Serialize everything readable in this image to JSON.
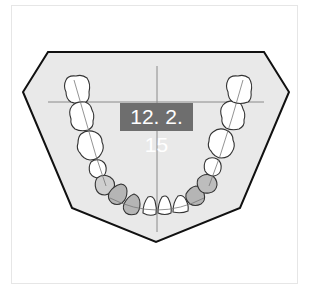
{
  "diagram": {
    "type": "dental-arch",
    "label": "12. 2. 15",
    "colors": {
      "base_fill": "#e9e9e9",
      "base_stroke": "#111111",
      "crosshair": "#8a8a8a",
      "tooth_fill": "#ffffff",
      "tooth_stroke": "#333333",
      "highlighted_tooth_fill": "#b5b5b5",
      "label_bg": "#6e6e6e",
      "label_text": "#ffffff"
    },
    "teeth": {
      "left": [
        "molar-3",
        "molar-2",
        "molar-1",
        "premolar-2",
        "premolar-1",
        "canine",
        "lateral-incisor",
        "central-incisor"
      ],
      "right": [
        "molar-3",
        "molar-2",
        "molar-1",
        "premolar-2",
        "premolar-1",
        "canine",
        "lateral-incisor",
        "central-incisor"
      ],
      "highlighted": [
        "left-premolar-1",
        "left-canine",
        "left-lateral-incisor",
        "right-premolar-1",
        "right-canine"
      ]
    }
  }
}
